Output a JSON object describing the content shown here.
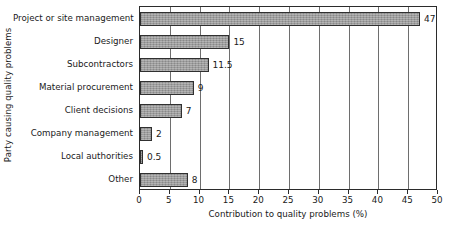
{
  "chart_data": {
    "type": "bar",
    "orientation": "horizontal",
    "title": "",
    "xlabel": "Contribution to quality problems (%)",
    "ylabel": "Party causing quality problems",
    "categories": [
      "Project or site management",
      "Designer",
      "Subcontractors",
      "Material procurement",
      "Client decisions",
      "Company management",
      "Local authorities",
      "Other"
    ],
    "values": [
      47,
      15,
      11.5,
      9,
      7,
      2,
      0.5,
      8
    ],
    "value_labels": [
      "47",
      "15",
      "11.5",
      "9",
      "7",
      "2",
      "0.5",
      "8"
    ],
    "xlim": [
      0,
      50
    ],
    "xticks": [
      0,
      5,
      10,
      15,
      20,
      25,
      30,
      35,
      40,
      45,
      50
    ],
    "xtick_labels": [
      "0",
      "5",
      "10",
      "15",
      "20",
      "25",
      "30",
      "35",
      "40",
      "45",
      "50"
    ],
    "grid": "vertical",
    "legend": "none",
    "colors": {
      "bar_fill": "#9c9c9c",
      "bar_border": "#303030",
      "gridline": "#6e6e6e",
      "frame": "#2b2b2b",
      "text": "#1a1a1a",
      "background": "#ffffff"
    }
  }
}
